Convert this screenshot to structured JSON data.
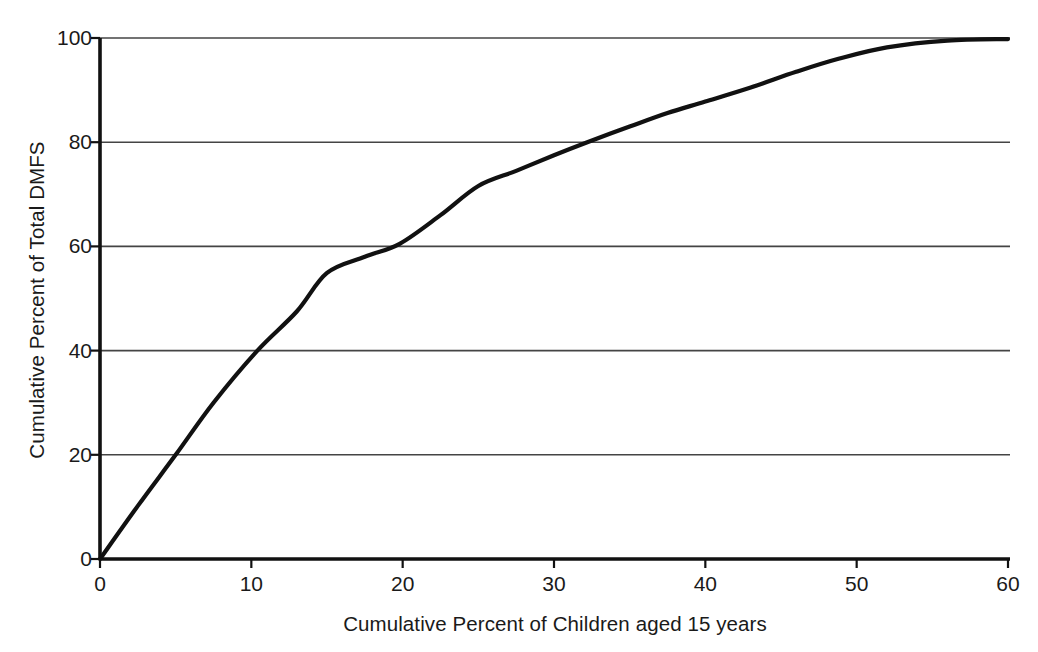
{
  "chart_data": {
    "type": "line",
    "title": "",
    "xlabel": "Cumulative Percent of Children aged 15 years",
    "ylabel": "Cumulative Percent of Total DMFS",
    "xlim": [
      0,
      60
    ],
    "ylim": [
      0,
      100
    ],
    "xticks": [
      0,
      10,
      20,
      30,
      40,
      50,
      60
    ],
    "yticks": [
      0,
      20,
      40,
      60,
      80,
      100
    ],
    "xtick_labels": [
      "0",
      "10",
      "20",
      "30",
      "40",
      "50",
      "60"
    ],
    "ytick_labels": [
      "0",
      "20",
      "40",
      "60",
      "80",
      "100"
    ],
    "grid": "horizontal",
    "legend": "none",
    "series": [
      {
        "name": "Cumulative DMFS distribution",
        "color": "#111111",
        "x": [
          0,
          2.5,
          5,
          7.5,
          10.4,
          13,
          15,
          17.5,
          19.8,
          22.5,
          25,
          27.5,
          30,
          32.2,
          35,
          37.5,
          40,
          43,
          46,
          48.8,
          52,
          56,
          60
        ],
        "values": [
          0,
          10.2,
          20,
          30,
          40,
          47.5,
          54.9,
          58,
          60.5,
          66,
          71.6,
          74.5,
          77.5,
          80,
          83,
          85.6,
          87.8,
          90.5,
          93.5,
          96,
          98.2,
          99.5,
          99.8
        ]
      }
    ]
  },
  "axis_colors": {
    "axis_line": "#111111",
    "grid_line": "#444444",
    "curve": "#111111"
  }
}
